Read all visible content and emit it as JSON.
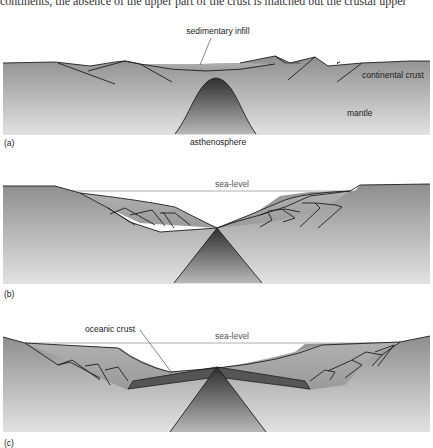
{
  "header_fragment": "continents, the absence of the upper part of the crust is matched but the crustal upper",
  "panels": [
    {
      "id": "a",
      "panel_label": "(a)",
      "labels": {
        "sedimentary_infill": "sedimentary infill",
        "continental_crust": "continental crust",
        "mantle": "mantle",
        "asthenosphere": "asthenosphere"
      }
    },
    {
      "id": "b",
      "panel_label": "(b)",
      "labels": {
        "sea_level": "sea-level"
      }
    },
    {
      "id": "c",
      "panel_label": "(c)",
      "labels": {
        "oceanic_crust": "oceanic crust",
        "sea_level": "sea-level"
      }
    }
  ],
  "colors": {
    "crust_top": "#8f8f8f",
    "mantle_bottom": "#dcdcdc",
    "sediment": "#a9a9a9",
    "asthenosphere_dark": "#3a3a3a",
    "oceanic_crust": "#5a5a5a",
    "outline": "#1e1e1e",
    "sea_level_line": "#999999"
  }
}
